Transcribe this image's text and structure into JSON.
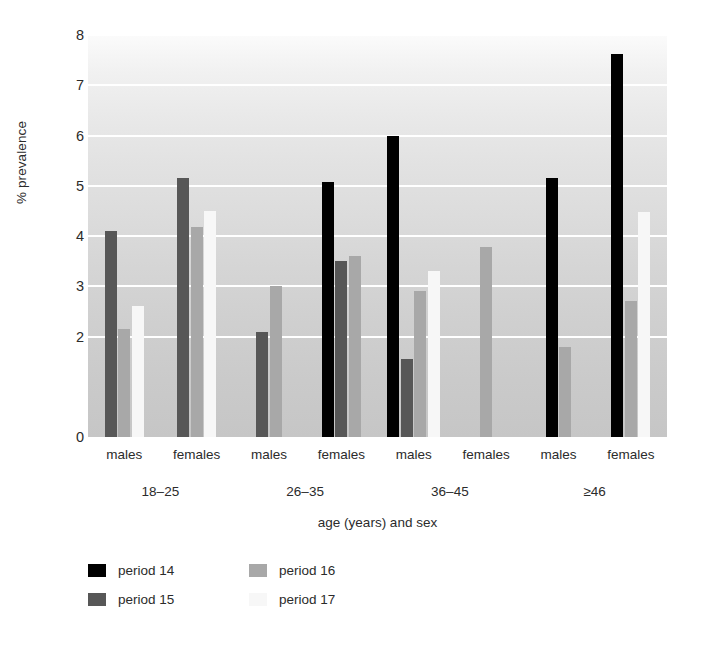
{
  "chart_data": {
    "type": "bar",
    "title": "",
    "xlabel": "age (years) and sex",
    "ylabel": "% prevalence",
    "ylim": [
      0,
      8
    ],
    "ytick_labels": [
      "0",
      "2",
      "3",
      "4",
      "5",
      "6",
      "7",
      "8"
    ],
    "ytick_values": [
      0,
      2,
      3,
      4,
      5,
      6,
      7,
      8
    ],
    "gridlines": [
      2,
      3,
      4,
      5,
      6,
      7,
      8
    ],
    "grid": true,
    "legend_position": "bottom-left",
    "categories": [
      "18–25 males",
      "18–25 females",
      "26–35 males",
      "26–35 females",
      "36–45 males",
      "36–45 females",
      "≥46 males",
      "≥46 females"
    ],
    "age_groups": [
      "18–25",
      "26–35",
      "36–45",
      "≥46"
    ],
    "sex_labels": [
      "males",
      "females",
      "males",
      "females",
      "males",
      "females",
      "males",
      "females"
    ],
    "series": [
      {
        "name": "period 14",
        "color": "#000000",
        "values": [
          null,
          null,
          null,
          5.08,
          6.0,
          null,
          5.15,
          7.62
        ]
      },
      {
        "name": "period 15",
        "color": "#575757",
        "values": [
          4.1,
          5.15,
          2.08,
          3.5,
          1.55,
          null,
          null,
          null
        ]
      },
      {
        "name": "period 16",
        "color": "#a8a8a8",
        "values": [
          2.15,
          4.17,
          3.0,
          3.6,
          2.9,
          3.78,
          1.8,
          2.7
        ]
      },
      {
        "name": "period 17",
        "color": "#f7f7f7",
        "values": [
          2.6,
          4.5,
          null,
          null,
          3.3,
          null,
          null,
          4.47
        ]
      }
    ]
  },
  "legend": {
    "items": [
      {
        "label": "period 14",
        "color": "#000000"
      },
      {
        "label": "period 15",
        "color": "#575757"
      },
      {
        "label": "period 16",
        "color": "#a8a8a8"
      },
      {
        "label": "period 17",
        "color": "#f7f7f7"
      }
    ]
  }
}
